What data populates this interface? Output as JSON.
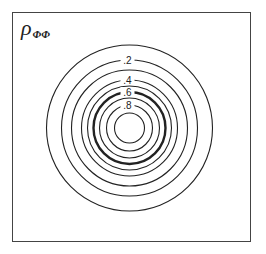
{
  "chart_data": {
    "type": "contour",
    "title_symbol": "ρ",
    "title_subscript": "ΦΦ",
    "xlabel": "",
    "ylabel": "",
    "center": [
      129.5,
      128
    ],
    "levels": [
      {
        "value": 0.1,
        "label": "",
        "radius": 83,
        "bold": false
      },
      {
        "value": 0.2,
        "label": ".2",
        "radius": 68,
        "bold": false
      },
      {
        "value": 0.3,
        "label": "",
        "radius": 58,
        "bold": false
      },
      {
        "value": 0.4,
        "label": ".4",
        "radius": 48,
        "bold": false
      },
      {
        "value": 0.5,
        "label": "",
        "radius": 42,
        "bold": false
      },
      {
        "value": 0.6,
        "label": ".6",
        "radius": 36,
        "bold": true
      },
      {
        "value": 0.7,
        "label": "",
        "radius": 30,
        "bold": false
      },
      {
        "value": 0.8,
        "label": ".8",
        "radius": 23,
        "bold": false
      },
      {
        "value": 0.9,
        "label": "",
        "radius": 15,
        "bold": false
      }
    ],
    "grid": false,
    "legend": "none"
  },
  "title": {
    "symbol": "ρ",
    "subscript": "ΦΦ"
  },
  "labels": [
    ".2",
    ".4",
    ".6",
    ".8"
  ],
  "colors": {
    "line": "#222222",
    "frame": "#444444",
    "background": "#ffffff"
  }
}
